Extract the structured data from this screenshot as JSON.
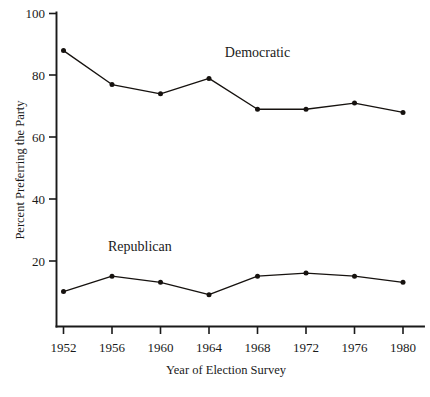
{
  "chart_data": {
    "type": "line",
    "title": "",
    "xlabel": "Year of Election Survey",
    "ylabel": "Percent Preferring the Party",
    "categories": [
      "1952",
      "1956",
      "1960",
      "1964",
      "1968",
      "1972",
      "1976",
      "1980"
    ],
    "x": [
      1952,
      1956,
      1960,
      1964,
      1968,
      1972,
      1976,
      1980
    ],
    "xlim": [
      1952,
      1980
    ],
    "ylim": [
      0,
      100
    ],
    "yticks": [
      20,
      40,
      60,
      80,
      100
    ],
    "ytick_labels": [
      "20",
      "40",
      "60",
      "80",
      "100"
    ],
    "grid": false,
    "legend": "inline-annotations",
    "series": [
      {
        "name": "Democratic",
        "label_position": "above-line-right-of-center",
        "values": [
          88,
          77,
          74,
          79,
          69,
          69,
          71,
          68
        ]
      },
      {
        "name": "Republican",
        "label_position": "above-line-left-of-center",
        "values": [
          10,
          15,
          13,
          9,
          15,
          16,
          15,
          13
        ]
      }
    ],
    "annotations": [
      {
        "text": "Democratic",
        "x": 1968,
        "y": 86
      },
      {
        "text": "Republican",
        "x": 1958.3,
        "y": 23
      }
    ],
    "marker": "filled-circle",
    "colors": {
      "line": "#16120f",
      "axis": "#1a1a1a",
      "background": "#ffffff"
    }
  },
  "axes": {
    "x_title": "Year of Election Survey",
    "y_title": "Percent Preferring the Party"
  }
}
